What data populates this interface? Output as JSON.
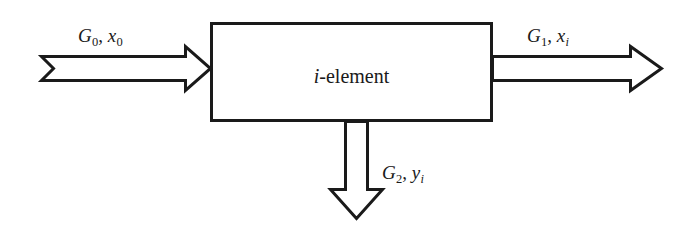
{
  "diagram": {
    "background_color": "#ffffff",
    "stroke_color": "#1a1a1a",
    "block": {
      "label_var": "i",
      "label_rest": "-element",
      "label_full": "i-element"
    },
    "flows": [
      {
        "id": "input-left",
        "direction": "right",
        "arrow_style": "notched-tail-block-arrow",
        "label_g": "G",
        "label_g_sub": "0",
        "separator": ", ",
        "label_x": "x",
        "label_x_sub": "0",
        "label_full": "G0, x0"
      },
      {
        "id": "output-right",
        "direction": "right",
        "arrow_style": "flat-tail-block-arrow",
        "label_g": "G",
        "label_g_sub": "1",
        "separator": ", ",
        "label_x": "x",
        "label_x_sub": "i",
        "label_full": "G1, xi"
      },
      {
        "id": "output-bottom",
        "direction": "down",
        "arrow_style": "flat-tail-block-arrow",
        "label_g": "G",
        "label_g_sub": "2",
        "separator": ", ",
        "label_x": "y",
        "label_x_sub": "i",
        "label_full": "G2, yi"
      }
    ]
  }
}
